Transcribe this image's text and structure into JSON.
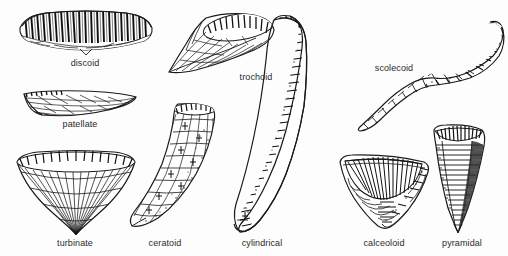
{
  "figure": {
    "background_color": "#fdfdfd",
    "ink_color": "#1a1a1a",
    "label_color": "#2b2b2b",
    "width": 508,
    "height": 256
  },
  "specimens": [
    {
      "id": "discoid",
      "label": "discoid",
      "label_x": 85,
      "label_y": 58,
      "description": "flattened disc-shaped corallum with dense radial septa",
      "shape_x": 16,
      "shape_y": 8,
      "shape_w": 140,
      "shape_h": 46
    },
    {
      "id": "patellate",
      "label": "patellate",
      "label_x": 80,
      "label_y": 119,
      "description": "low shallow cone, wider than tall",
      "shape_x": 22,
      "shape_y": 88,
      "shape_w": 118,
      "shape_h": 30
    },
    {
      "id": "turbinate",
      "label": "turbinate",
      "label_x": 75,
      "label_y": 238,
      "description": "broad inverted cone with sharp apex",
      "shape_x": 14,
      "shape_y": 150,
      "shape_w": 122,
      "shape_h": 84
    },
    {
      "id": "trochoid",
      "label": "trochoid",
      "label_x": 256,
      "label_y": 72,
      "description": "tilted cone with open calyx, tapering obliquely",
      "shape_x": 166,
      "shape_y": 10,
      "shape_w": 110,
      "shape_h": 62
    },
    {
      "id": "ceratoid",
      "label": "ceratoid",
      "label_x": 165,
      "label_y": 238,
      "description": "curved horn-shaped corallum tapering to a point",
      "shape_x": 126,
      "shape_y": 100,
      "shape_w": 92,
      "shape_h": 132
    },
    {
      "id": "cylindrical",
      "label": "cylindrical",
      "label_x": 262,
      "label_y": 238,
      "description": "long slender gently curved tube of near constant width",
      "shape_x": 228,
      "shape_y": 14,
      "shape_w": 78,
      "shape_h": 218
    },
    {
      "id": "scolecoid",
      "label": "scolecoid",
      "label_x": 394,
      "label_y": 63,
      "description": "irregular sinuous worm-like corallum",
      "shape_x": 352,
      "shape_y": 18,
      "shape_w": 152,
      "shape_h": 112
    },
    {
      "id": "calceoloid",
      "label": "calceoloid",
      "label_x": 384,
      "label_y": 238,
      "description": "slipper-shaped triangular corallum with deep curved calyx",
      "shape_x": 336,
      "shape_y": 152,
      "shape_w": 96,
      "shape_h": 76
    },
    {
      "id": "pyramidal",
      "label": "pyramidal",
      "label_x": 462,
      "label_y": 238,
      "description": "narrow elongate triangular corallum with horizontal growth lines",
      "shape_x": 428,
      "shape_y": 122,
      "shape_w": 62,
      "shape_h": 110
    }
  ]
}
